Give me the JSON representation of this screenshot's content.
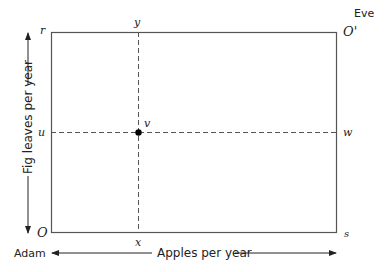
{
  "diagram": {
    "type": "edgeworth-box",
    "corner_labels": {
      "top_left": "r",
      "top_right": "O'",
      "bottom_left": "O",
      "bottom_right": "s"
    },
    "owners": {
      "origin_bottom_left": "Adam",
      "origin_top_right": "Eve"
    },
    "axes": {
      "horizontal_label": "Apples per year",
      "vertical_label": "Fig leaves per year"
    },
    "dashed_line_labels": {
      "vertical_top": "y",
      "vertical_bottom": "x",
      "horizontal_left": "u",
      "horizontal_right": "w"
    },
    "point": {
      "label": "v"
    },
    "colors": {
      "line": "#555555",
      "text": "#222222",
      "point": "#000000"
    }
  }
}
